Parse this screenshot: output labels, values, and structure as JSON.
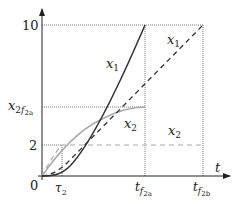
{
  "diagram": {
    "axes": {
      "x_label": "t",
      "y_ticks": [
        "10",
        "2"
      ],
      "y_tick_special": {
        "base": "x",
        "sub": "2",
        "subsub_base": "f",
        "subsub": "2a"
      },
      "origin": "0"
    },
    "x_ticks": [
      {
        "base": "τ",
        "sub": "2"
      },
      {
        "base": "t",
        "sub": "f",
        "subsub": "2a"
      },
      {
        "base": "t",
        "sub": "f",
        "subsub": "2b"
      }
    ],
    "curve_labels": [
      {
        "base": "x",
        "sub": "1",
        "curve": "solid dark x1 (tf2a case)"
      },
      {
        "base": "x",
        "sub": "1",
        "curve": "dashed dark x1 (tf2b case)"
      },
      {
        "base": "x",
        "sub": "2",
        "curve": "solid gray x2 (tf2a case)"
      },
      {
        "base": "x",
        "sub": "2",
        "curve": "dashed gray x2 (tf2b case)"
      }
    ],
    "colors": {
      "dark_curve": "#333333",
      "light_curve": "#aaaaaa",
      "axis": "#222222",
      "guide": "#555555"
    }
  }
}
